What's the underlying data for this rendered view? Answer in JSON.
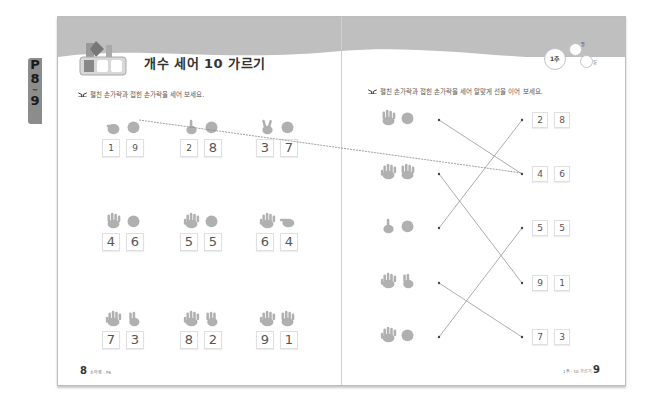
{
  "side_tab": {
    "label_p": "P",
    "label_start": "8",
    "label_sep": "~",
    "label_end": "9"
  },
  "header": {
    "badge": {
      "num": "1",
      "day": "일",
      "cha": "차"
    },
    "title": "개수 세어 10 가르기",
    "week": "1주",
    "month_label": "월",
    "day_label": "일"
  },
  "left_page": {
    "instruction": "펼친 손가락과 접힌 손가락을 세어 보세요.",
    "problems": [
      {
        "open": "1",
        "closed": "9"
      },
      {
        "open": "2",
        "closed": "8"
      },
      {
        "open": "3",
        "closed": "7"
      },
      {
        "open": "4",
        "closed": "6"
      },
      {
        "open": "5",
        "closed": "5"
      },
      {
        "open": "6",
        "closed": "4"
      },
      {
        "open": "7",
        "closed": "3"
      },
      {
        "open": "8",
        "closed": "2"
      },
      {
        "open": "9",
        "closed": "1"
      }
    ],
    "footer": {
      "page": "8",
      "text": "소마셈 - P6"
    }
  },
  "right_page": {
    "instruction": "펼친 손가락과 접힌 손가락을 세어 알맞게 선을 이어 보세요.",
    "left_items": [
      "4 open + closed",
      "9 open",
      "1 open + closed",
      "7 open",
      "5 open + closed"
    ],
    "right_pairs": [
      {
        "a": "2",
        "b": "8"
      },
      {
        "a": "4",
        "b": "6"
      },
      {
        "a": "5",
        "b": "5"
      },
      {
        "a": "9",
        "b": "1"
      },
      {
        "a": "7",
        "b": "3"
      }
    ],
    "footer": {
      "page": "9",
      "text": "1주 - 10 가르기"
    }
  },
  "colors": {
    "band": "#bfbfbf",
    "hand": "#b0b0b0",
    "text": "#555555",
    "tab": "#8c8c8c"
  }
}
